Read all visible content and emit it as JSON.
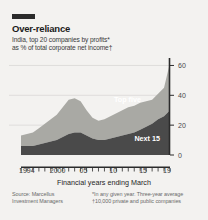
{
  "figure": {
    "tag": "",
    "title": "Over-reliance",
    "subtitle_line1": "India, top 20 companies by profits*",
    "subtitle_line2": "as % of total corporate net income†",
    "xaxis_caption": "Financial years ending March",
    "source_left_line1": "Source: Marcellus",
    "source_left_line2": "Investment Managers",
    "source_right_line1": "*In any given year. Three-year average",
    "source_right_line2": "†10,000 private and public companies",
    "colors": {
      "background": "#f3f2f0",
      "top_five": "#a9a9a4",
      "next_15": "#4a4a4a",
      "gridline": "#d9d8d5",
      "axis": "#2b2b2b",
      "tag": "#2b2b2b"
    }
  },
  "chart_data": {
    "type": "area",
    "stacked": true,
    "title": "Over-reliance",
    "subtitle": "India, top 20 companies by profits*, as % of total corporate net income†",
    "xlabel": "Financial years ending March",
    "ylabel": "",
    "ylim": [
      0,
      65
    ],
    "yticks": [
      0,
      20,
      40,
      60
    ],
    "ytick_labels": [
      "0",
      "20",
      "40",
      "60"
    ],
    "xlim": [
      1994,
      2019
    ],
    "xticks": [
      1994,
      2000,
      2005,
      2010,
      2015,
      2019
    ],
    "xtick_labels": [
      "1994",
      "2000",
      "05",
      "10",
      "15",
      "19"
    ],
    "grid": true,
    "legend": "in-plot",
    "x": [
      1994,
      1995,
      1996,
      1997,
      1998,
      1999,
      2000,
      2001,
      2002,
      2003,
      2004,
      2005,
      2006,
      2007,
      2008,
      2009,
      2010,
      2011,
      2012,
      2013,
      2014,
      2015,
      2016,
      2017,
      2018,
      2019
    ],
    "series": [
      {
        "name": "Next 15",
        "color": "#4a4a4a",
        "values": [
          6,
          6,
          6,
          7,
          8,
          9,
          10,
          12,
          14,
          15,
          15,
          13,
          11,
          10,
          10,
          11,
          12,
          13,
          14,
          15,
          17,
          19,
          21,
          24,
          26,
          30
        ]
      },
      {
        "name": "Top five",
        "color": "#a9a9a4",
        "values": [
          7,
          8,
          9,
          11,
          13,
          15,
          17,
          20,
          23,
          23,
          21,
          17,
          14,
          13,
          14,
          15,
          16,
          17,
          18,
          18,
          18,
          17,
          16,
          17,
          19,
          32
        ]
      }
    ],
    "totals": [
      13,
      14,
      15,
      18,
      21,
      24,
      27,
      32,
      37,
      38,
      36,
      30,
      25,
      23,
      24,
      26,
      28,
      30,
      32,
      33,
      35,
      36,
      37,
      41,
      45,
      62
    ],
    "annotations": [
      {
        "text": "Top five",
        "x": 2014,
        "y": 40
      },
      {
        "text": "Next 15",
        "x": 2015,
        "y": 9
      }
    ]
  }
}
